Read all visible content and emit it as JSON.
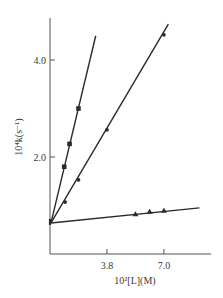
{
  "chart_data": {
    "type": "line",
    "title": "",
    "xlabel": "10²[L](M)",
    "ylabel": "10⁴k(s⁻¹)",
    "x_ticks": [
      {
        "value": 3.8,
        "label": "3.8"
      },
      {
        "value": 7.0,
        "label": "7.0"
      }
    ],
    "y_ticks": [
      {
        "value": 2.0,
        "label": "2.0"
      },
      {
        "value": 4.0,
        "label": "4.0"
      }
    ],
    "xlim": [
      0.6,
      9.5
    ],
    "ylim": [
      0,
      4.9
    ],
    "grid": false,
    "legend": null,
    "common_intercept": {
      "x": 0.6,
      "y": 0.64
    },
    "series": [
      {
        "name": "squares",
        "marker": "square",
        "points": [
          {
            "x": 1.4,
            "y": 1.8
          },
          {
            "x": 1.7,
            "y": 2.27
          },
          {
            "x": 2.2,
            "y": 3.0
          }
        ],
        "line": {
          "from": {
            "x": 0.6,
            "y": 0.64
          },
          "to": {
            "x": 3.17,
            "y": 4.5
          }
        }
      },
      {
        "name": "circles",
        "marker": "circle",
        "points": [
          {
            "x": 1.45,
            "y": 1.07
          },
          {
            "x": 2.2,
            "y": 1.53
          },
          {
            "x": 3.8,
            "y": 2.56
          },
          {
            "x": 7.0,
            "y": 4.52
          }
        ],
        "line": {
          "from": {
            "x": 0.6,
            "y": 0.64
          },
          "to": {
            "x": 7.25,
            "y": 4.74
          }
        }
      },
      {
        "name": "triangles",
        "marker": "triangle",
        "points": [
          {
            "x": 5.4,
            "y": 0.82
          },
          {
            "x": 6.2,
            "y": 0.87
          },
          {
            "x": 7.0,
            "y": 0.89
          }
        ],
        "line": {
          "from": {
            "x": 0.6,
            "y": 0.64
          },
          "to": {
            "x": 9.0,
            "y": 0.95
          }
        }
      }
    ]
  },
  "colors": {
    "ink": "#2b2b2b",
    "axis": "#555555",
    "background": "#ffffff"
  }
}
